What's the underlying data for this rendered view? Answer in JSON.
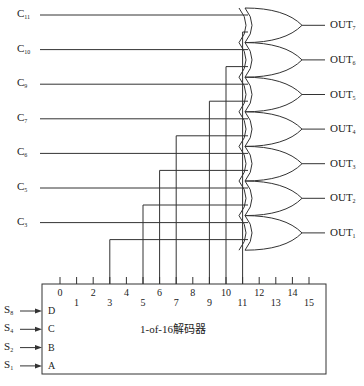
{
  "diagram": {
    "type": "decoder-or-gate-circuit",
    "decoder": {
      "label": "1-of-16解码器",
      "inputs": [
        {
          "signal": "S",
          "sub": "8",
          "pin": "D"
        },
        {
          "signal": "S",
          "sub": "4",
          "pin": "C"
        },
        {
          "signal": "S",
          "sub": "2",
          "pin": "B"
        },
        {
          "signal": "S",
          "sub": "1",
          "pin": "A"
        }
      ],
      "outputs": [
        "0",
        "1",
        "2",
        "3",
        "4",
        "5",
        "6",
        "7",
        "8",
        "9",
        "10",
        "11",
        "12",
        "13",
        "14",
        "15"
      ]
    },
    "control_lines": [
      {
        "signal": "C",
        "sub": "11"
      },
      {
        "signal": "C",
        "sub": "10"
      },
      {
        "signal": "C",
        "sub": "9"
      },
      {
        "signal": "C",
        "sub": "7"
      },
      {
        "signal": "C",
        "sub": "6"
      },
      {
        "signal": "C",
        "sub": "5"
      },
      {
        "signal": "C",
        "sub": "3"
      }
    ],
    "gate_outputs": [
      {
        "signal": "OUT",
        "sub": "7"
      },
      {
        "signal": "OUT",
        "sub": "6"
      },
      {
        "signal": "OUT",
        "sub": "5"
      },
      {
        "signal": "OUT",
        "sub": "4"
      },
      {
        "signal": "OUT",
        "sub": "3"
      },
      {
        "signal": "OUT",
        "sub": "2"
      },
      {
        "signal": "OUT",
        "sub": "1"
      }
    ],
    "gate_type": "OR",
    "decoder_outputs_used": [
      "11",
      "10",
      "9",
      "7",
      "6",
      "5",
      "3"
    ]
  }
}
